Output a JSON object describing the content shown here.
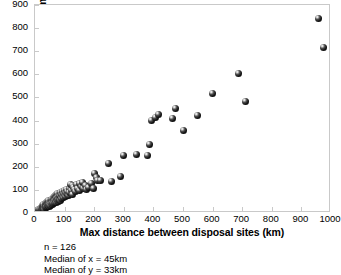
{
  "chart_data": {
    "type": "scatter",
    "title": "",
    "xlabel": "Max distance between disposal sites (km)",
    "ylabel": "Max distance from home (km)",
    "xlim": [
      0,
      1000
    ],
    "ylim": [
      0,
      900
    ],
    "xticks": [
      0,
      100,
      200,
      300,
      400,
      500,
      600,
      700,
      800,
      900,
      1000
    ],
    "yticks": [
      0,
      100,
      200,
      300,
      400,
      500,
      600,
      700,
      800,
      900
    ],
    "grid": false,
    "legend": null,
    "marker": {
      "shape": "sphere",
      "color": "#111111",
      "highlight": "#ffffff",
      "size_px": 7
    },
    "annotations": [
      "n = 126",
      "Median of x = 45km",
      "Median of y = 33km"
    ],
    "series": [
      {
        "name": "Badger disposal-site vs home range",
        "points": [
          [
            5,
            4
          ],
          [
            8,
            6
          ],
          [
            10,
            9
          ],
          [
            12,
            7
          ],
          [
            13,
            13
          ],
          [
            15,
            10
          ],
          [
            16,
            17
          ],
          [
            18,
            12
          ],
          [
            19,
            20
          ],
          [
            20,
            15
          ],
          [
            21,
            9
          ],
          [
            22,
            24
          ],
          [
            23,
            18
          ],
          [
            24,
            28
          ],
          [
            25,
            14
          ],
          [
            26,
            22
          ],
          [
            27,
            31
          ],
          [
            28,
            19
          ],
          [
            29,
            26
          ],
          [
            30,
            35
          ],
          [
            31,
            21
          ],
          [
            32,
            29
          ],
          [
            33,
            16
          ],
          [
            34,
            38
          ],
          [
            35,
            25
          ],
          [
            36,
            33
          ],
          [
            37,
            42
          ],
          [
            38,
            23
          ],
          [
            39,
            30
          ],
          [
            40,
            45
          ],
          [
            41,
            27
          ],
          [
            42,
            36
          ],
          [
            43,
            48
          ],
          [
            44,
            32
          ],
          [
            45,
            33
          ],
          [
            46,
            40
          ],
          [
            47,
            52
          ],
          [
            48,
            29
          ],
          [
            49,
            44
          ],
          [
            50,
            37
          ],
          [
            52,
            55
          ],
          [
            53,
            41
          ],
          [
            54,
            34
          ],
          [
            55,
            49
          ],
          [
            56,
            60
          ],
          [
            57,
            43
          ],
          [
            58,
            38
          ],
          [
            59,
            57
          ],
          [
            60,
            46
          ],
          [
            61,
            66
          ],
          [
            62,
            51
          ],
          [
            63,
            42
          ],
          [
            64,
            63
          ],
          [
            65,
            54
          ],
          [
            66,
            70
          ],
          [
            67,
            47
          ],
          [
            68,
            58
          ],
          [
            69,
            75
          ],
          [
            70,
            52
          ],
          [
            71,
            65
          ],
          [
            72,
            44
          ],
          [
            73,
            78
          ],
          [
            74,
            61
          ],
          [
            75,
            56
          ],
          [
            76,
            83
          ],
          [
            77,
            68
          ],
          [
            78,
            49
          ],
          [
            79,
            72
          ],
          [
            80,
            59
          ],
          [
            82,
            86
          ],
          [
            83,
            64
          ],
          [
            84,
            76
          ],
          [
            85,
            55
          ],
          [
            86,
            90
          ],
          [
            88,
            69
          ],
          [
            89,
            80
          ],
          [
            90,
            62
          ],
          [
            92,
            95
          ],
          [
            94,
            74
          ],
          [
            95,
            85
          ],
          [
            96,
            66
          ],
          [
            98,
            99
          ],
          [
            100,
            78
          ],
          [
            102,
            90
          ],
          [
            104,
            71
          ],
          [
            106,
            103
          ],
          [
            108,
            83
          ],
          [
            110,
            94
          ],
          [
            112,
            76
          ],
          [
            115,
            108
          ],
          [
            118,
            87
          ],
          [
            120,
            125
          ],
          [
            122,
            98
          ],
          [
            125,
            118
          ],
          [
            128,
            80
          ],
          [
            130,
            112
          ],
          [
            133,
            101
          ],
          [
            136,
            92
          ],
          [
            140,
            122
          ],
          [
            145,
            105
          ],
          [
            150,
            128
          ],
          [
            152,
            96
          ],
          [
            158,
            115
          ],
          [
            162,
            132
          ],
          [
            165,
            108
          ],
          [
            170,
            120
          ],
          [
            175,
            100
          ],
          [
            180,
            112
          ],
          [
            190,
            127
          ],
          [
            196,
            108
          ],
          [
            200,
            170
          ],
          [
            208,
            152
          ],
          [
            212,
            139
          ],
          [
            222,
            141
          ],
          [
            248,
            215
          ],
          [
            258,
            135
          ],
          [
            288,
            160
          ],
          [
            300,
            249
          ],
          [
            342,
            254
          ],
          [
            380,
            250
          ],
          [
            388,
            298
          ],
          [
            392,
            401
          ],
          [
            406,
            412
          ],
          [
            418,
            428
          ],
          [
            466,
            410
          ],
          [
            473,
            452
          ],
          [
            500,
            359
          ],
          [
            548,
            422
          ],
          [
            598,
            519
          ],
          [
            688,
            603
          ],
          [
            712,
            482
          ],
          [
            958,
            842
          ],
          [
            975,
            715
          ]
        ]
      }
    ]
  }
}
